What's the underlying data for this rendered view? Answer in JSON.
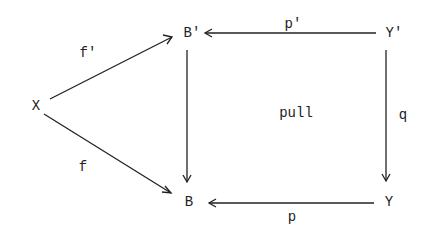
{
  "diagram": {
    "type": "commutative-diagram",
    "nodes": {
      "X": "X",
      "B_prime": "B'",
      "B": "B",
      "Y_prime": "Y'",
      "Y": "Y"
    },
    "arrows": {
      "f_prime": "f'",
      "f": "f",
      "p_prime": "p'",
      "p": "p",
      "q": "q",
      "vertical_left": ""
    },
    "center_label": "pull",
    "edges": [
      {
        "from": "X",
        "to": "B'",
        "label": "f'"
      },
      {
        "from": "X",
        "to": "B",
        "label": "f"
      },
      {
        "from": "Y'",
        "to": "B'",
        "label": "p'"
      },
      {
        "from": "Y",
        "to": "B",
        "label": "p"
      },
      {
        "from": "Y'",
        "to": "Y",
        "label": "q"
      },
      {
        "from": "B'",
        "to": "B",
        "label": ""
      }
    ],
    "colors": {
      "ink": "#222222",
      "background": "#ffffff"
    }
  }
}
